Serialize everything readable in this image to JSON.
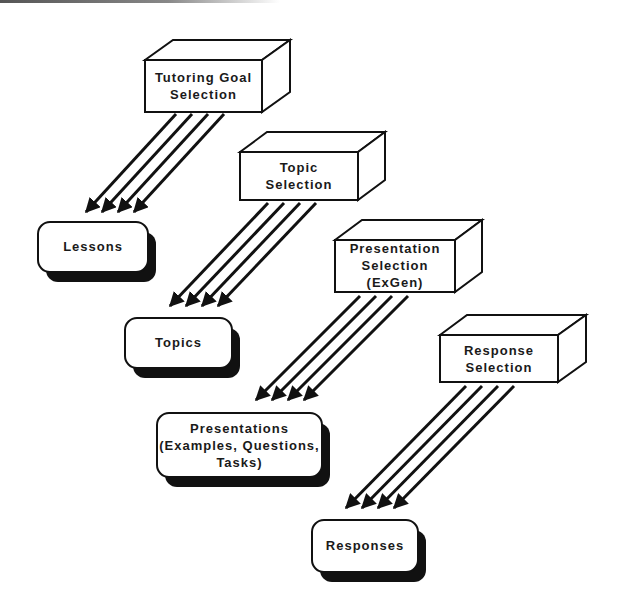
{
  "diagram": {
    "type": "flow",
    "selectors": [
      {
        "id": "goal",
        "label": "Tutoring  Goal\nSelection"
      },
      {
        "id": "topic",
        "label": "Topic\nSelection"
      },
      {
        "id": "presentation",
        "label": "Presentation\nSelection\n(ExGen)"
      },
      {
        "id": "response",
        "label": "Response\nSelection"
      }
    ],
    "outputs": [
      {
        "id": "lessons",
        "label": "Lessons"
      },
      {
        "id": "topics",
        "label": "Topics"
      },
      {
        "id": "presentations",
        "label": "Presentations\n(Examples,  Questions,\nTasks)"
      },
      {
        "id": "responses",
        "label": "Responses"
      }
    ],
    "edges": [
      {
        "from": "goal",
        "to": "lessons",
        "arrows": 4
      },
      {
        "from": "topic",
        "to": "topics",
        "arrows": 4
      },
      {
        "from": "presentation",
        "to": "presentations",
        "arrows": 4
      },
      {
        "from": "response",
        "to": "responses",
        "arrows": 4
      }
    ],
    "colors": {
      "ink": "#111111",
      "fill": "#ffffff"
    }
  }
}
